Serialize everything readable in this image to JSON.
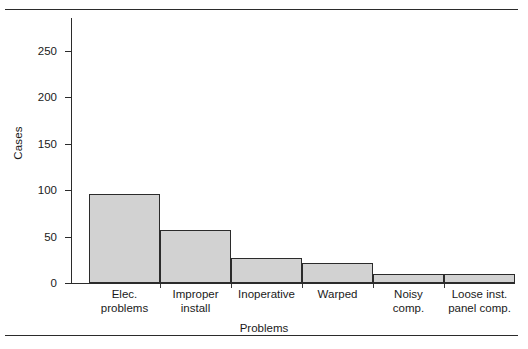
{
  "figure": {
    "kind": "bar-chart-figure",
    "rule_color": "#2b2b2b"
  },
  "axes": {
    "y_title": "Cases",
    "x_title": "Problems",
    "y_ticks": [
      "0",
      "50",
      "100",
      "150",
      "200",
      "250"
    ]
  },
  "chart_data": {
    "type": "bar",
    "title": "",
    "xlabel": "Problems",
    "ylabel": "Cases",
    "categories": [
      "Elec. problems",
      "Improper install",
      "Inoperative",
      "Warped",
      "Noisy comp.",
      "Loose inst. panel comp."
    ],
    "category_lines": [
      [
        "Elec.",
        "problems"
      ],
      [
        "Improper",
        "install"
      ],
      [
        "Inoperative",
        ""
      ],
      [
        "Warped",
        ""
      ],
      [
        "Noisy",
        "comp."
      ],
      [
        "Loose inst.",
        "panel comp."
      ]
    ],
    "values": [
      96,
      57,
      27,
      21,
      10,
      10
    ],
    "ylim": [
      0,
      285
    ],
    "yticks": [
      0,
      50,
      100,
      150,
      200,
      250
    ],
    "grid": false,
    "legend": null,
    "bar_fill": "#d2d2d2",
    "bar_edge": "#2b2b2b",
    "bars_adjacent": true
  }
}
